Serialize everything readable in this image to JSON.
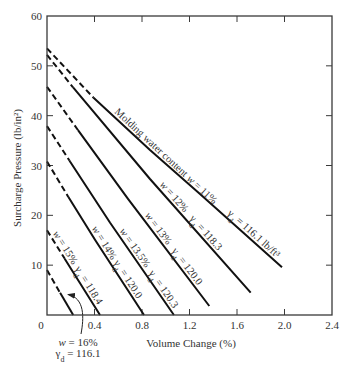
{
  "chart_data": {
    "type": "line",
    "title": "",
    "xlabel": "Volume Change (%)",
    "ylabel": "Surcharge Pressure (lb/in²)",
    "xlim": [
      0,
      2.4
    ],
    "ylim": [
      0,
      60
    ],
    "xticks": [
      0.4,
      0.8,
      1.2,
      1.6,
      2.0,
      2.4
    ],
    "xtick_labels": [
      "0.4",
      "0.8",
      "1.2",
      "1.6",
      "2.0",
      "2.4"
    ],
    "yticks": [
      10,
      20,
      30,
      40,
      50,
      60
    ],
    "ytick_labels": [
      "10",
      "20",
      "30",
      "40",
      "50",
      "60"
    ],
    "origin_label": "0",
    "grid": false,
    "legend": null,
    "line_style_note": "dashed segments near the y-axis are extrapolations; solid segments are measured",
    "series": [
      {
        "name": "w = 11%",
        "molding_water_content_pct": 11,
        "dry_unit_weight_pcf": 116.1,
        "label_w": "Molding water content w = 11%",
        "label_gamma": "γd = 116.1 lb/ft³",
        "label_w_at_x": 0.547,
        "label_gamma_at_x": 1.499,
        "dashed_until_x": 0.39,
        "x": [
          0,
          0.387,
          0.867,
          1.288,
          1.979
        ],
        "y": [
          53.5,
          43.7,
          33.1,
          24.3,
          9.6
        ]
      },
      {
        "name": "w = 12%",
        "molding_water_content_pct": 12,
        "dry_unit_weight_pcf": 118.3,
        "label_w": "w = 12%",
        "label_gamma": "γd = 118.3",
        "label_w_at_x": 0.926,
        "label_gamma_at_x": 1.179,
        "dashed_until_x": 0.22,
        "x": [
          0,
          0.219,
          0.867,
          1.715
        ],
        "y": [
          52.2,
          45.7,
          27.3,
          4.5
        ]
      },
      {
        "name": "w = 13%",
        "molding_water_content_pct": 13,
        "dry_unit_weight_pcf": 120.0,
        "label_w": "w = 13%",
        "label_gamma": "γd = 120.0",
        "label_w_at_x": 0.8,
        "label_gamma_at_x": 1.027,
        "dashed_until_x": 0.26,
        "x": [
          0,
          0.261,
          0.682,
          1.367
        ],
        "y": [
          45.8,
          37.1,
          23.3,
          1.8
        ]
      },
      {
        "name": "w = 13.5%",
        "molding_water_content_pct": 13.5,
        "dry_unit_weight_pcf": 120.3,
        "label_w": "w = 13.5%",
        "label_gamma": "γd = 120.3",
        "label_w_at_x": 0.589,
        "label_gamma_at_x": 0.834,
        "dashed_until_x": 0.19,
        "x": [
          0,
          0.194,
          0.531,
          1.069
        ],
        "y": [
          37.9,
          30.8,
          18.5,
          0
        ]
      },
      {
        "name": "w = 14%",
        "molding_water_content_pct": 14,
        "dry_unit_weight_pcf": 120.0,
        "label_w": "w = 14%",
        "label_gamma": "γd = 120.0",
        "label_w_at_x": 0.354,
        "label_gamma_at_x": 0.539,
        "dashed_until_x": 0.18,
        "x": [
          0,
          0.177,
          0.404,
          0.817
        ],
        "y": [
          30.8,
          23.8,
          15.1,
          0
        ]
      },
      {
        "name": "w = 15%",
        "molding_water_content_pct": 15,
        "dry_unit_weight_pcf": 118.4,
        "label_w": "w = 15%",
        "label_gamma": "γd = 118.4",
        "label_w_at_x": 0.025,
        "label_gamma_at_x": 0.211,
        "dashed_until_x": 0.15,
        "x": [
          0,
          0.152,
          0.446
        ],
        "y": [
          17.0,
          11.2,
          0
        ]
      },
      {
        "name": "w = 16%",
        "molding_water_content_pct": 16,
        "dry_unit_weight_pcf": 116.1,
        "label_w": "",
        "label_gamma": "",
        "dashed_until_x": 0.11,
        "x": [
          0,
          0.109,
          0.221
        ],
        "y": [
          9.0,
          4.5,
          0
        ]
      }
    ],
    "annotations": [
      {
        "target_series": "w = 16%",
        "text_lines": [
          "w = 16%",
          "γd = 116.1"
        ],
        "has_arrow": true
      }
    ]
  }
}
